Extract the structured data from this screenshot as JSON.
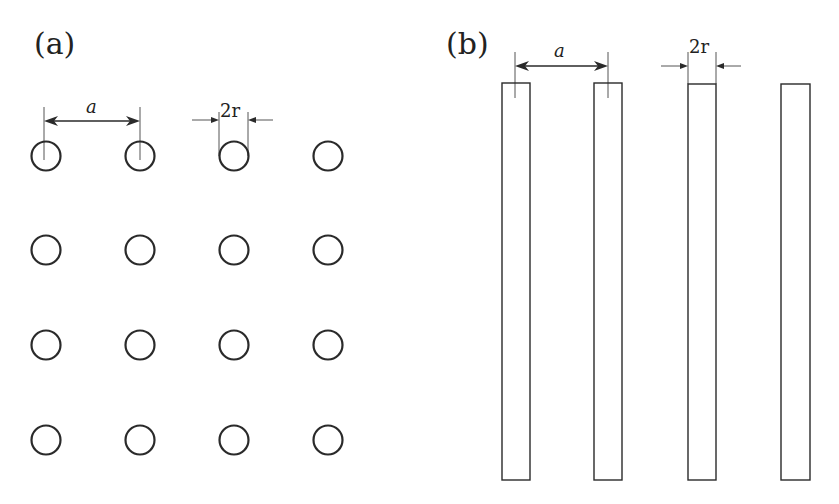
{
  "panels": [
    {
      "id": "a",
      "label": "(a)",
      "description": "4x4 square lattice of circular rods (cross-section)",
      "rows": 4,
      "cols": 4,
      "dim_spacing": "a",
      "dim_diameter": "2r"
    },
    {
      "id": "b",
      "label": "(b)",
      "description": "Row of 4 parallel rectangular rods (side view)",
      "count": 4,
      "dim_spacing": "a",
      "dim_width": "2r"
    }
  ],
  "colors": {
    "stroke": "#2a2a2a",
    "background": "#ffffff"
  }
}
